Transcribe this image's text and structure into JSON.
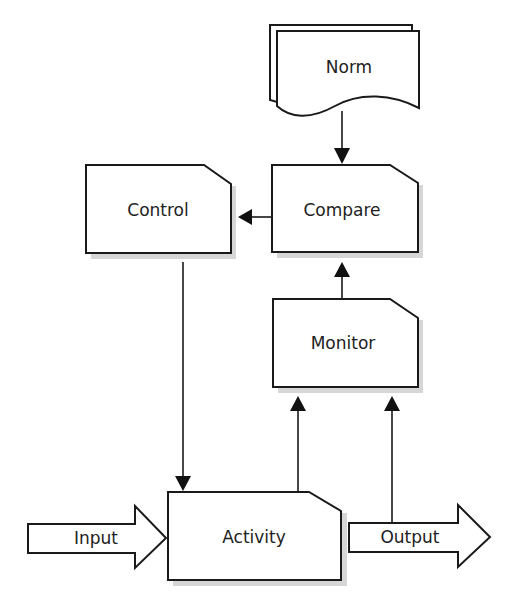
{
  "diagram": {
    "type": "control-loop-flowchart",
    "nodes": [
      {
        "id": "norm",
        "label": "Norm",
        "shape": "multi-document"
      },
      {
        "id": "compare",
        "label": "Compare",
        "shape": "cut-corner-box"
      },
      {
        "id": "control",
        "label": "Control",
        "shape": "cut-corner-box"
      },
      {
        "id": "monitor",
        "label": "Monitor",
        "shape": "cut-corner-box"
      },
      {
        "id": "activity",
        "label": "Activity",
        "shape": "cut-corner-box"
      },
      {
        "id": "input",
        "label": "Input",
        "shape": "block-arrow"
      },
      {
        "id": "output",
        "label": "Output",
        "shape": "block-arrow"
      }
    ],
    "edges": [
      {
        "from": "norm",
        "to": "compare"
      },
      {
        "from": "compare",
        "to": "control"
      },
      {
        "from": "monitor",
        "to": "compare"
      },
      {
        "from": "control",
        "to": "activity"
      },
      {
        "from": "activity",
        "to": "monitor"
      },
      {
        "from": "output",
        "to": "monitor"
      },
      {
        "from": "input",
        "to": "activity"
      },
      {
        "from": "activity",
        "to": "output"
      }
    ]
  },
  "labels": {
    "norm": "Norm",
    "compare": "Compare",
    "control": "Control",
    "monitor": "Monitor",
    "activity": "Activity",
    "input": "Input",
    "output": "Output"
  },
  "colors": {
    "stroke": "#1a1a1a",
    "fill": "#ffffff",
    "shadow": "#d6d6d6",
    "text": "#222222"
  }
}
